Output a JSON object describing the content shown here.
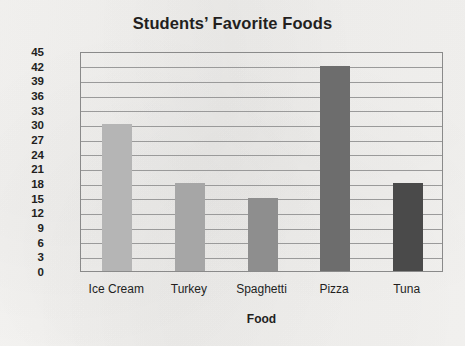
{
  "chart_data": {
    "type": "bar",
    "title": "Students’ Favorite Foods",
    "xlabel": "Food",
    "ylabel": "Number of Students",
    "categories": [
      "Ice Cream",
      "Turkey",
      "Spaghetti",
      "Pizza",
      "Tuna"
    ],
    "values": [
      30,
      18,
      15,
      42,
      18
    ],
    "bar_colors": [
      "#b5b5b5",
      "#a6a6a6",
      "#8e8e8e",
      "#6d6d6d",
      "#4a4a4a"
    ],
    "ylim": [
      0,
      45
    ],
    "ytick_step": 3,
    "yticks": [
      45,
      42,
      39,
      36,
      33,
      30,
      27,
      24,
      21,
      18,
      15,
      12,
      9,
      6,
      3,
      0
    ],
    "grid": true,
    "grid_axis": "y",
    "legend": "none",
    "axis_color": "#8a8a8a",
    "grid_color": "#9a9a9a",
    "text_color": "#231f1e",
    "background_color": "#f3f2f0"
  }
}
